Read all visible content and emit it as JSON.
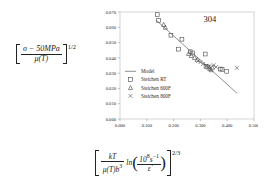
{
  "chart_data": {
    "type": "scatter",
    "title": "",
    "annotation": "304",
    "xlabel_text": "[ kT / (mu(T) b^3) * ln( 10^8 s^-1 / edot ) ]^(2/3)",
    "ylabel_text": "[ (sigma - 50MPa) / mu(T) ]^(1/2)",
    "xlim": [
      0.0,
      0.5
    ],
    "ylim": [
      0.0,
      0.07
    ],
    "xticks": [
      "0.000",
      "0.100",
      "0.200",
      "0.300",
      "0.400",
      "0.500"
    ],
    "xtick_values": [
      0.0,
      0.1,
      0.2,
      0.3,
      0.4,
      0.5
    ],
    "yticks": [
      "0.000",
      "0.010",
      "0.020",
      "0.030",
      "0.040",
      "0.050",
      "0.060",
      "0.070"
    ],
    "ytick_values": [
      0.0,
      0.01,
      0.02,
      0.03,
      0.04,
      0.05,
      0.06,
      0.07
    ],
    "grid": false,
    "legend_position": "inner-left",
    "series": [
      {
        "name": "Model",
        "marker": "line",
        "color": "#7a7a7a",
        "points": [
          [
            0.134,
            0.0648
          ],
          [
            0.437,
            0.0168
          ]
        ]
      },
      {
        "name": "Steichen RT",
        "marker": "square",
        "color": "#555555",
        "points": [
          [
            0.139,
            0.0683
          ],
          [
            0.144,
            0.0645
          ],
          [
            0.19,
            0.0548
          ],
          [
            0.231,
            0.0522
          ],
          [
            0.218,
            0.0457
          ],
          [
            0.262,
            0.044
          ],
          [
            0.271,
            0.0432
          ],
          [
            0.318,
            0.0425
          ],
          [
            0.321,
            0.0345
          ],
          [
            0.328,
            0.034
          ],
          [
            0.374,
            0.0327
          ],
          [
            0.381,
            0.0325
          ],
          [
            0.398,
            0.0312
          ]
        ]
      },
      {
        "name": "Steichen 600F",
        "marker": "triangle",
        "color": "#555555",
        "points": [
          [
            0.163,
            0.0618
          ],
          [
            0.169,
            0.06
          ],
          [
            0.256,
            0.0428
          ],
          [
            0.266,
            0.0415
          ],
          [
            0.278,
            0.0402
          ],
          [
            0.288,
            0.0388
          ],
          [
            0.335,
            0.033
          ],
          [
            0.34,
            0.0322
          ],
          [
            0.345,
            0.0338
          ]
        ]
      },
      {
        "name": "Steichen 800F",
        "marker": "cross",
        "color": "#555555",
        "points": [
          [
            0.292,
            0.038
          ],
          [
            0.3,
            0.0372
          ],
          [
            0.31,
            0.036
          ],
          [
            0.322,
            0.0348
          ],
          [
            0.333,
            0.0345
          ],
          [
            0.35,
            0.0352
          ],
          [
            0.358,
            0.034
          ],
          [
            0.436,
            0.0335
          ]
        ]
      }
    ]
  },
  "legend": {
    "items": [
      {
        "label": "Model",
        "marker": "line"
      },
      {
        "label": "Steichen RT",
        "marker": "square"
      },
      {
        "label": "Steichen 600F",
        "marker": "triangle"
      },
      {
        "label": "Steichen 800F",
        "marker": "cross"
      }
    ]
  },
  "ylabel": {
    "numerator": "σ − 50MPa",
    "denominator": "μ(T)",
    "exponent": "1/2"
  },
  "xlabel": {
    "frac_num": "kT",
    "frac_den_mu": "μ(T)b",
    "frac_den_exp": "3",
    "ln": "ln",
    "inner_num_base": "10",
    "inner_num_exp": "8",
    "inner_num_unit": "s",
    "inner_num_unit_exp": "−1",
    "inner_den": "ε̇",
    "exponent": "2/3"
  }
}
